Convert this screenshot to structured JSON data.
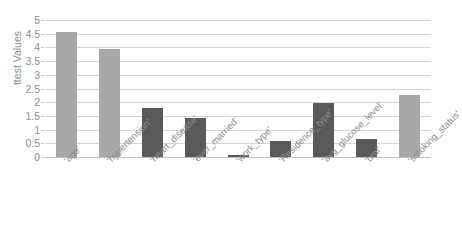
{
  "chart_data": {
    "type": "bar",
    "title": "Absolute ttest Values for Feature Selection",
    "xlabel": "",
    "ylabel": "ttest Values",
    "ylim": [
      0,
      5
    ],
    "yticks": [
      "0",
      "0.5",
      "1",
      "1.5",
      "2",
      "2.5",
      "3",
      "3.5",
      "4",
      "4.5",
      "5"
    ],
    "grid": true,
    "legend": "none",
    "categories": [
      "'age'",
      "'hypertension'",
      "'heart_disease'",
      "'ever_married'",
      "'work_type'",
      "'Residence_type'",
      "'avg_glucose_level'",
      "'bmi'",
      "'smoking_status'"
    ],
    "values": [
      4.55,
      3.95,
      1.78,
      1.42,
      0.06,
      0.58,
      1.97,
      0.65,
      2.28
    ],
    "bar_colors": [
      "#a8a8a8",
      "#a8a8a8",
      "#595959",
      "#595959",
      "#595959",
      "#595959",
      "#595959",
      "#595959",
      "#a8a8a8"
    ]
  },
  "colors": {
    "bar_light": "#a8a8a8",
    "bar_dark": "#595959",
    "gridline": "#d6d6d6",
    "axis_text": "#8d8d8d",
    "background": "#ffffff"
  }
}
